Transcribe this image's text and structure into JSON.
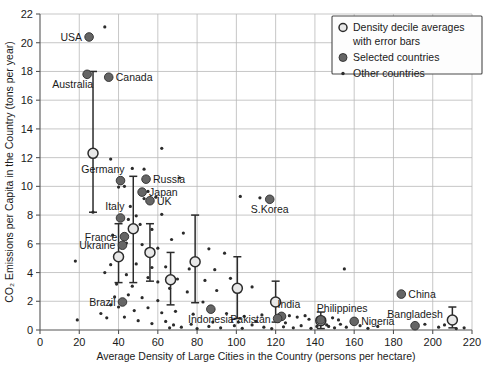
{
  "chart_data": {
    "type": "scatter",
    "title": "",
    "xlabel": "Average Density of Large Cities in the Country (persons per hectare)",
    "ylabel": "CO₂ Emissions per Capita in the Country (tons per year)",
    "xlim": [
      0,
      220
    ],
    "ylim": [
      0,
      22
    ],
    "xticks": [
      0,
      20,
      40,
      60,
      80,
      100,
      120,
      140,
      160,
      180,
      200,
      220
    ],
    "yticks": [
      0,
      2,
      4,
      6,
      8,
      10,
      12,
      14,
      16,
      18,
      20,
      22
    ],
    "grid": true,
    "legend_position": "top-right",
    "legend": [
      {
        "marker": "open-circle",
        "label": "Density decile averages"
      },
      {
        "marker": "none",
        "label": "with error bars"
      },
      {
        "marker": "filled-circle",
        "label": "Selected countries"
      },
      {
        "marker": "small-dot",
        "label": "Other countries"
      }
    ],
    "series": [
      {
        "name": "Density decile averages with error bars",
        "marker": "open-circle",
        "points": [
          {
            "x": 27,
            "y": 12.3,
            "lo": 8.2,
            "hi": 18.0
          },
          {
            "x": 40,
            "y": 5.1,
            "lo": 3.3,
            "hi": 7.4
          },
          {
            "x": 47.5,
            "y": 7.05,
            "lo": 3.3,
            "hi": 10.7
          },
          {
            "x": 56,
            "y": 5.4,
            "lo": 3.4,
            "hi": 7.4
          },
          {
            "x": 66.5,
            "y": 3.5,
            "lo": 1.75,
            "hi": 5.4
          },
          {
            "x": 79,
            "y": 4.75,
            "lo": 1.9,
            "hi": 8.0
          },
          {
            "x": 100.5,
            "y": 2.9,
            "lo": 0.8,
            "hi": 5.1
          },
          {
            "x": 120,
            "y": 1.95,
            "lo": 0.55,
            "hi": 3.4
          },
          {
            "x": 143,
            "y": 0.65,
            "lo": 0.1,
            "hi": 1.25
          },
          {
            "x": 210,
            "y": 0.7,
            "lo": 0.15,
            "hi": 1.6
          }
        ]
      },
      {
        "name": "Selected countries",
        "marker": "filled-circle",
        "points": [
          {
            "x": 25,
            "y": 20.4,
            "label": "USA",
            "lpos": "left"
          },
          {
            "x": 24,
            "y": 17.8,
            "label": "Australia",
            "lpos": "below-left"
          },
          {
            "x": 35,
            "y": 17.6,
            "label": "Canada",
            "lpos": "right"
          },
          {
            "x": 41,
            "y": 10.4,
            "label": "Germany",
            "lpos": "above-left"
          },
          {
            "x": 54,
            "y": 10.5,
            "label": "Russia",
            "lpos": "right"
          },
          {
            "x": 52,
            "y": 9.6,
            "label": "Japan",
            "lpos": "right"
          },
          {
            "x": 56,
            "y": 9.0,
            "label": "UK",
            "lpos": "right"
          },
          {
            "x": 117,
            "y": 9.1,
            "label": "S.Korea",
            "lpos": "below"
          },
          {
            "x": 41,
            "y": 7.8,
            "label": "Italy",
            "lpos": "above-left"
          },
          {
            "x": 43,
            "y": 6.5,
            "label": "France",
            "lpos": "left"
          },
          {
            "x": 42,
            "y": 5.9,
            "label": "Ukraine",
            "lpos": "left"
          },
          {
            "x": 42,
            "y": 1.95,
            "label": "Brazil",
            "lpos": "left"
          },
          {
            "x": 184,
            "y": 2.5,
            "label": "China",
            "lpos": "right"
          },
          {
            "x": 87,
            "y": 1.45,
            "label": "Indonesia",
            "lpos": "below"
          },
          {
            "x": 123,
            "y": 0.95,
            "label": "India",
            "lpos": "above-right"
          },
          {
            "x": 121,
            "y": 0.8,
            "label": "Pakistan",
            "lpos": "left"
          },
          {
            "x": 143,
            "y": 0.7,
            "label": "Philippines",
            "lpos": "above-right"
          },
          {
            "x": 160,
            "y": 0.6,
            "label": "Nigeria",
            "lpos": "right"
          },
          {
            "x": 191,
            "y": 0.3,
            "label": "Bangladesh",
            "lpos": "above"
          }
        ]
      },
      {
        "name": "Other countries",
        "marker": "small-dot",
        "points": [
          {
            "x": 33,
            "y": 21.1
          },
          {
            "x": 36,
            "y": 11.9
          },
          {
            "x": 62,
            "y": 12.65
          },
          {
            "x": 47,
            "y": 11.25
          },
          {
            "x": 53,
            "y": 11.2
          },
          {
            "x": 71,
            "y": 10.6
          },
          {
            "x": 43,
            "y": 10.0
          },
          {
            "x": 40,
            "y": 9.95
          },
          {
            "x": 55,
            "y": 9.65
          },
          {
            "x": 53,
            "y": 9.15
          },
          {
            "x": 59,
            "y": 9.25
          },
          {
            "x": 112,
            "y": 9.2
          },
          {
            "x": 116,
            "y": 9.1
          },
          {
            "x": 102,
            "y": 9.3
          },
          {
            "x": 27,
            "y": 8.2
          },
          {
            "x": 46,
            "y": 8.6
          },
          {
            "x": 62,
            "y": 8.05
          },
          {
            "x": 49,
            "y": 7.95
          },
          {
            "x": 45,
            "y": 7.7
          },
          {
            "x": 51,
            "y": 7.35
          },
          {
            "x": 57,
            "y": 7.0
          },
          {
            "x": 73,
            "y": 6.75
          },
          {
            "x": 67,
            "y": 6.3
          },
          {
            "x": 37,
            "y": 6.6
          },
          {
            "x": 44,
            "y": 6.05
          },
          {
            "x": 52,
            "y": 5.95
          },
          {
            "x": 60,
            "y": 5.7
          },
          {
            "x": 86,
            "y": 5.65
          },
          {
            "x": 94,
            "y": 5.35
          },
          {
            "x": 18,
            "y": 4.8
          },
          {
            "x": 36,
            "y": 4.55
          },
          {
            "x": 49,
            "y": 4.6
          },
          {
            "x": 57,
            "y": 4.35
          },
          {
            "x": 64,
            "y": 4.4
          },
          {
            "x": 76,
            "y": 4.25
          },
          {
            "x": 89,
            "y": 4.2
          },
          {
            "x": 33,
            "y": 4.0
          },
          {
            "x": 44,
            "y": 3.85
          },
          {
            "x": 55,
            "y": 3.65
          },
          {
            "x": 60,
            "y": 3.35
          },
          {
            "x": 70,
            "y": 3.55
          },
          {
            "x": 84,
            "y": 3.45
          },
          {
            "x": 97,
            "y": 3.6
          },
          {
            "x": 155,
            "y": 4.25
          },
          {
            "x": 108,
            "y": 3.0
          },
          {
            "x": 39,
            "y": 3.2
          },
          {
            "x": 47,
            "y": 3.05
          },
          {
            "x": 66,
            "y": 2.9
          },
          {
            "x": 75,
            "y": 2.65
          },
          {
            "x": 90,
            "y": 2.75
          },
          {
            "x": 38,
            "y": 2.3
          },
          {
            "x": 45,
            "y": 2.45
          },
          {
            "x": 52,
            "y": 2.25
          },
          {
            "x": 60,
            "y": 2.05
          },
          {
            "x": 83,
            "y": 1.95
          },
          {
            "x": 36,
            "y": 1.75
          },
          {
            "x": 40,
            "y": 1.6
          },
          {
            "x": 48,
            "y": 1.35
          },
          {
            "x": 55,
            "y": 1.55
          },
          {
            "x": 62,
            "y": 1.2
          },
          {
            "x": 69,
            "y": 1.3
          },
          {
            "x": 78,
            "y": 1.1
          },
          {
            "x": 95,
            "y": 1.15
          },
          {
            "x": 104,
            "y": 0.95
          },
          {
            "x": 113,
            "y": 1.05
          },
          {
            "x": 127,
            "y": 1.0
          },
          {
            "x": 131,
            "y": 0.9
          },
          {
            "x": 135,
            "y": 1.0
          },
          {
            "x": 137,
            "y": 0.75
          },
          {
            "x": 149,
            "y": 0.85
          },
          {
            "x": 152,
            "y": 0.7
          },
          {
            "x": 19,
            "y": 0.7
          },
          {
            "x": 31,
            "y": 1.15
          },
          {
            "x": 34,
            "y": 0.85
          },
          {
            "x": 43,
            "y": 0.9
          },
          {
            "x": 50,
            "y": 0.65
          },
          {
            "x": 57,
            "y": 0.45
          },
          {
            "x": 64,
            "y": 0.6
          },
          {
            "x": 66,
            "y": 0.15
          },
          {
            "x": 68,
            "y": 0.35
          },
          {
            "x": 72,
            "y": 0.2
          },
          {
            "x": 77,
            "y": 0.4
          },
          {
            "x": 80,
            "y": 0.1
          },
          {
            "x": 86,
            "y": 0.25
          },
          {
            "x": 92,
            "y": 0.15
          },
          {
            "x": 99,
            "y": 0.3
          },
          {
            "x": 103,
            "y": 0.12
          },
          {
            "x": 108,
            "y": 0.35
          },
          {
            "x": 114,
            "y": 0.2
          },
          {
            "x": 118,
            "y": 0.1
          },
          {
            "x": 124,
            "y": 0.22
          },
          {
            "x": 129,
            "y": 0.15
          },
          {
            "x": 133,
            "y": 0.3
          },
          {
            "x": 138,
            "y": 0.12
          },
          {
            "x": 141,
            "y": 0.25
          },
          {
            "x": 146,
            "y": 0.35
          },
          {
            "x": 150,
            "y": 0.15
          },
          {
            "x": 156,
            "y": 0.2
          },
          {
            "x": 163,
            "y": 0.3
          },
          {
            "x": 167,
            "y": 0.12
          },
          {
            "x": 172,
            "y": 0.25
          },
          {
            "x": 196,
            "y": 0.4
          },
          {
            "x": 203,
            "y": 0.2
          },
          {
            "x": 206,
            "y": 0.35
          },
          {
            "x": 216,
            "y": 0.15
          },
          {
            "x": 212,
            "y": 0.1
          },
          {
            "x": 125,
            "y": 0.5
          },
          {
            "x": 159,
            "y": 0.45
          },
          {
            "x": 144,
            "y": 0.5
          },
          {
            "x": 147,
            "y": 0.25
          },
          {
            "x": 153,
            "y": 0.4
          },
          {
            "x": 88,
            "y": 0.55
          },
          {
            "x": 101,
            "y": 0.55
          },
          {
            "x": 110,
            "y": 0.6
          }
        ]
      }
    ]
  },
  "colors": {
    "grid": "#b9b9b9",
    "axis": "#555555",
    "selected_marker": "#656565",
    "other_marker": "#2b2b2b",
    "decile_marker_fill": "#e8e8e8",
    "decile_marker_stroke": "#2b2b2b"
  }
}
